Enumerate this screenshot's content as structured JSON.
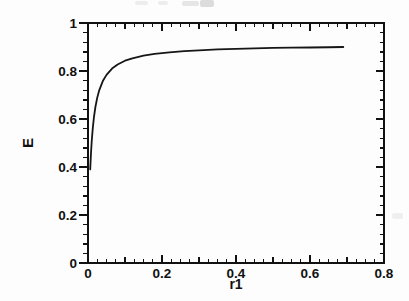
{
  "chart_data": {
    "type": "line",
    "title": "",
    "xlabel": "r1",
    "ylabel": "E",
    "xlim": [
      0,
      0.8
    ],
    "ylim": [
      0,
      1
    ],
    "grid": false,
    "legend": "none",
    "frame": "box-with-mirrored-ticks",
    "line_color": "#161616",
    "axis_color": "#111111",
    "x_major_ticks": [
      0,
      0.2,
      0.4,
      0.6,
      0.8
    ],
    "x_tick_labels": [
      "0",
      "0.2",
      "0.4",
      "0.6",
      "0.8"
    ],
    "x_minor_step": 0.025,
    "y_major_ticks": [
      0,
      0.2,
      0.4,
      0.6,
      0.8,
      1
    ],
    "y_tick_labels": [
      "0",
      "0.2",
      "0.4",
      "0.6",
      "0.8",
      "1"
    ],
    "y_minor_step": 0.04,
    "series": [
      {
        "name": "E vs r1",
        "x": [
          0.006,
          0.008,
          0.01,
          0.013,
          0.016,
          0.02,
          0.025,
          0.03,
          0.04,
          0.05,
          0.065,
          0.08,
          0.1,
          0.12,
          0.15,
          0.18,
          0.22,
          0.26,
          0.3,
          0.35,
          0.4,
          0.45,
          0.5,
          0.55,
          0.6,
          0.65,
          0.69
        ],
        "y": [
          0.39,
          0.455,
          0.506,
          0.563,
          0.607,
          0.65,
          0.689,
          0.718,
          0.758,
          0.784,
          0.81,
          0.827,
          0.843,
          0.853,
          0.864,
          0.871,
          0.878,
          0.883,
          0.886,
          0.89,
          0.892,
          0.894,
          0.896,
          0.897,
          0.898,
          0.899,
          0.9
        ]
      }
    ],
    "plateau_value": 0.9,
    "curve_start": {
      "x": 0.006,
      "y": 0.39
    },
    "curve_end": {
      "x": 0.69,
      "y": 0.9
    }
  }
}
